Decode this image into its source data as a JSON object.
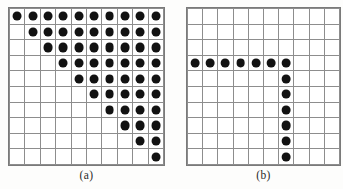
{
  "figure": {
    "background_color": "#fdfdfc",
    "dot_color": "#121212",
    "grid_line_color": "#8d8d8d",
    "cell_background": "#ffffff"
  },
  "panels": [
    {
      "id": "panel-a",
      "label": "(a)",
      "rows": 10,
      "cols": 10,
      "cell_width": 14.4,
      "cell_height": 14.6,
      "pattern_name": "upper-triangular-staircase",
      "filled": [
        [
          1,
          1,
          1,
          1,
          1,
          1,
          1,
          1,
          1,
          1
        ],
        [
          0,
          1,
          1,
          1,
          1,
          1,
          1,
          1,
          1,
          1
        ],
        [
          0,
          0,
          1,
          1,
          1,
          1,
          1,
          1,
          1,
          1
        ],
        [
          0,
          0,
          0,
          1,
          1,
          1,
          1,
          1,
          1,
          1
        ],
        [
          0,
          0,
          0,
          0,
          1,
          1,
          1,
          1,
          1,
          1
        ],
        [
          0,
          0,
          0,
          0,
          0,
          1,
          1,
          1,
          1,
          1
        ],
        [
          0,
          0,
          0,
          0,
          0,
          0,
          1,
          1,
          1,
          1
        ],
        [
          0,
          0,
          0,
          0,
          0,
          0,
          0,
          1,
          1,
          1
        ],
        [
          0,
          0,
          0,
          0,
          0,
          0,
          0,
          0,
          1,
          1
        ],
        [
          0,
          0,
          0,
          0,
          0,
          0,
          0,
          0,
          0,
          1
        ]
      ]
    },
    {
      "id": "panel-b",
      "label": "(b)",
      "rows": 10,
      "cols": 10,
      "cell_width": 14.2,
      "cell_height": 14.6,
      "pattern_name": "inverted-L-row4-col7",
      "filled": [
        [
          0,
          0,
          0,
          0,
          0,
          0,
          0,
          0,
          0,
          0
        ],
        [
          0,
          0,
          0,
          0,
          0,
          0,
          0,
          0,
          0,
          0
        ],
        [
          0,
          0,
          0,
          0,
          0,
          0,
          0,
          0,
          0,
          0
        ],
        [
          1,
          1,
          1,
          1,
          1,
          1,
          1,
          0,
          0,
          0
        ],
        [
          0,
          0,
          0,
          0,
          0,
          0,
          1,
          0,
          0,
          0
        ],
        [
          0,
          0,
          0,
          0,
          0,
          0,
          1,
          0,
          0,
          0
        ],
        [
          0,
          0,
          0,
          0,
          0,
          0,
          1,
          0,
          0,
          0
        ],
        [
          0,
          0,
          0,
          0,
          0,
          0,
          1,
          0,
          0,
          0
        ],
        [
          0,
          0,
          0,
          0,
          0,
          0,
          1,
          0,
          0,
          0
        ],
        [
          0,
          0,
          0,
          0,
          0,
          0,
          1,
          0,
          0,
          0
        ]
      ]
    }
  ]
}
